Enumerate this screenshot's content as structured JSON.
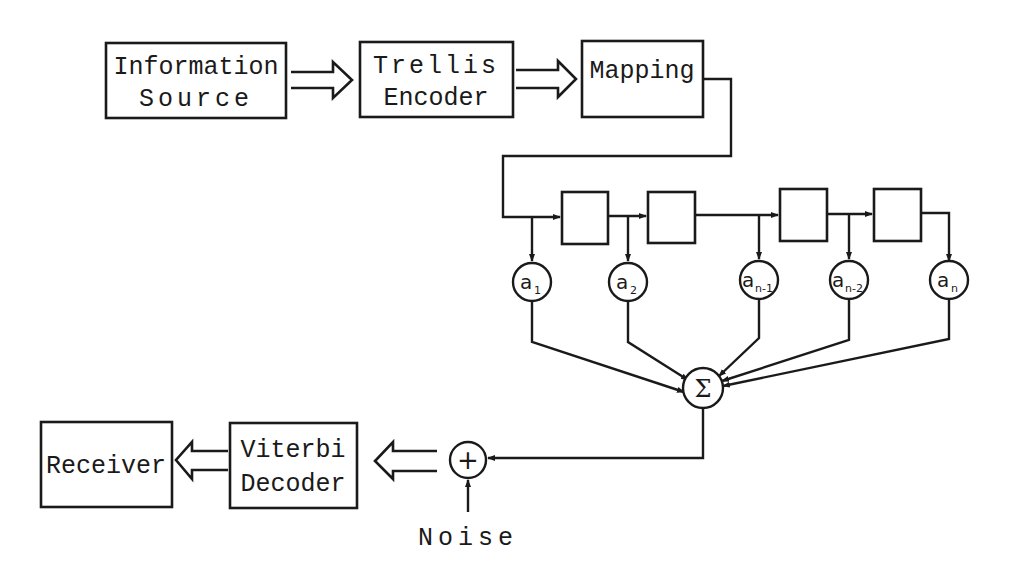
{
  "diagram": {
    "blocks": {
      "info_source": {
        "line1": "Information",
        "line2": "Source"
      },
      "trellis_encoder": {
        "line1": "Trellis",
        "line2": "Encoder"
      },
      "mapping": {
        "label": "Mapping"
      },
      "viterbi_decoder": {
        "line1": "Viterbi",
        "line2": "Decoder"
      },
      "receiver": {
        "label": "Receiver"
      }
    },
    "delay_line": {
      "delays": 4,
      "taps": [
        {
          "base": "a",
          "sub": "1"
        },
        {
          "base": "a",
          "sub": "2"
        },
        {
          "base": "a",
          "sub": "n-1"
        },
        {
          "base": "a",
          "sub": "n-2"
        },
        {
          "base": "a",
          "sub": "n"
        }
      ]
    },
    "summer": {
      "symbol": "Σ"
    },
    "adder": {
      "symbol": "+"
    },
    "noise": {
      "label": "Noise"
    },
    "colors": {
      "stroke": "#1a1a1a",
      "background": "#ffffff"
    }
  }
}
